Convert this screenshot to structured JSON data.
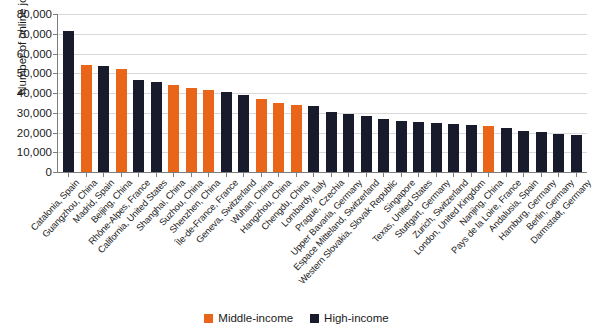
{
  "chart_data": {
    "type": "bar",
    "title": "",
    "xlabel": "",
    "ylabel": "Number of online job postings",
    "ylim": [
      0,
      80000
    ],
    "ytick_labels": [
      "80,000",
      "70,000",
      "60,000",
      "50,000",
      "40,000",
      "30,000",
      "20,000",
      "10,000",
      "0"
    ],
    "ytick_values": [
      80000,
      70000,
      60000,
      50000,
      40000,
      30000,
      20000,
      10000,
      0
    ],
    "grid": true,
    "legend_position": "bottom-center",
    "legend": [
      {
        "label": "Middle-income",
        "color": "#E8651A",
        "key": "mid"
      },
      {
        "label": "High-income",
        "color": "#171B2B",
        "key": "high"
      }
    ],
    "categories": [
      "Catalonia, Spain",
      "Guangzhou, China",
      "Madrid, Spain",
      "Beijing, China",
      "Rhône-Alpes, France",
      "California, United States",
      "Shanghai, China",
      "Suzhou, China",
      "Shenzhen, China",
      "Île-de-France, France",
      "Geneva, Switzerland",
      "Wuhan, China",
      "Hangzhou, China",
      "Chengdu, China",
      "Lombardy, Italy",
      "Prague, Czechia",
      "Upper Bavaria, Germany",
      "Espace Mitteland, Switzerland",
      "Western Slovakia, Slovak Republic",
      "Singapore",
      "Texas, United States",
      "Stuttgart, Germany",
      "Zurich, Switzerland",
      "London, United Kingdom",
      "Nanjing, China",
      "Pays de la Loire, France",
      "Andalusia, Spain",
      "Hamburg, Germany",
      "Berlin, Germany",
      "Darmstadt, Germany"
    ],
    "values": [
      71500,
      54000,
      53500,
      52000,
      46500,
      45500,
      44000,
      42500,
      41500,
      40500,
      39000,
      37000,
      35000,
      34000,
      33500,
      30500,
      29500,
      28500,
      27000,
      26000,
      25500,
      25000,
      24500,
      24000,
      23500,
      22500,
      21000,
      20500,
      19500,
      18500
    ],
    "income_groups": [
      "high",
      "mid",
      "high",
      "mid",
      "high",
      "high",
      "mid",
      "mid",
      "mid",
      "high",
      "high",
      "mid",
      "mid",
      "mid",
      "high",
      "high",
      "high",
      "high",
      "high",
      "high",
      "high",
      "high",
      "high",
      "high",
      "mid",
      "high",
      "high",
      "high",
      "high",
      "high"
    ]
  }
}
